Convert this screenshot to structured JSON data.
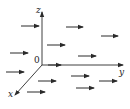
{
  "diagram": {
    "origin": {
      "x": 42,
      "y": 65,
      "label": "0"
    },
    "axes": [
      {
        "name": "z",
        "label": "z",
        "x2": 42,
        "y2": 12,
        "lx": 36,
        "ly": 13
      },
      {
        "name": "y",
        "label": "y",
        "x2": 123,
        "y2": 65,
        "lx": 119,
        "ly": 75
      },
      {
        "name": "x",
        "label": "x",
        "x2": 15,
        "y2": 95,
        "lx": 8,
        "ly": 97
      }
    ],
    "vectors": [
      {
        "x1": 21,
        "y1": 26,
        "x2": 39,
        "y2": 26
      },
      {
        "x1": 66,
        "y1": 27,
        "x2": 83,
        "y2": 27
      },
      {
        "x1": 101,
        "y1": 36,
        "x2": 118,
        "y2": 36
      },
      {
        "x1": 10,
        "y1": 53,
        "x2": 28,
        "y2": 53
      },
      {
        "x1": 47,
        "y1": 45,
        "x2": 65,
        "y2": 45
      },
      {
        "x1": 78,
        "y1": 56,
        "x2": 96,
        "y2": 56
      },
      {
        "x1": 48,
        "y1": 65,
        "x2": 61,
        "y2": 65
      },
      {
        "x1": 6,
        "y1": 72,
        "x2": 24,
        "y2": 72
      },
      {
        "x1": 71,
        "y1": 76,
        "x2": 89,
        "y2": 76
      },
      {
        "x1": 38,
        "y1": 81,
        "x2": 56,
        "y2": 81
      },
      {
        "x1": 99,
        "y1": 81,
        "x2": 117,
        "y2": 81
      },
      {
        "x1": 76,
        "y1": 88,
        "x2": 94,
        "y2": 88
      },
      {
        "x1": 27,
        "y1": 92,
        "x2": 45,
        "y2": 92
      }
    ],
    "colors": {
      "stroke": "#2a2a2a",
      "background": "#ffffff"
    }
  }
}
